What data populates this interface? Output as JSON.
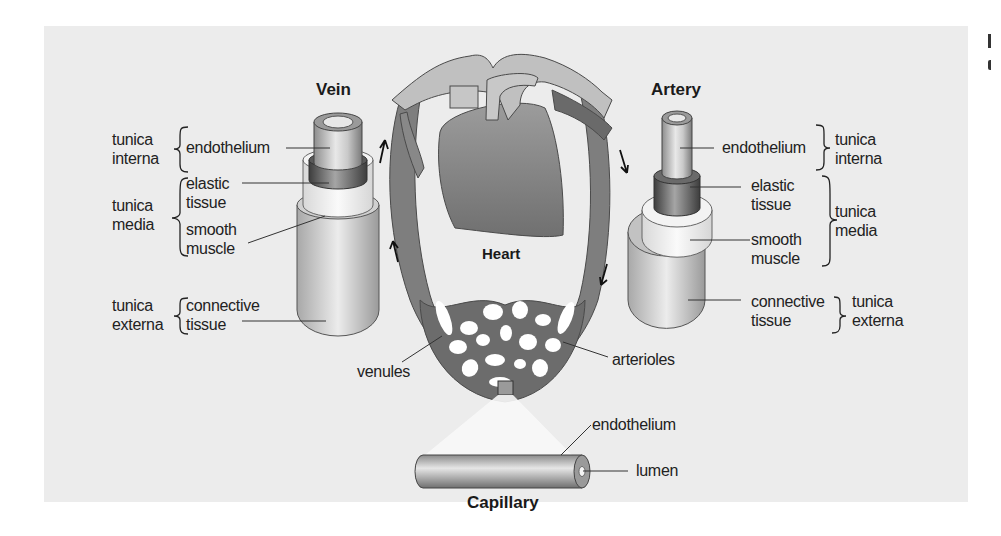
{
  "figure": {
    "background_color": "#ececec",
    "vein": {
      "title": "Vein",
      "groups": [
        {
          "tunica": [
            "tunica",
            "interna"
          ],
          "layers": [
            "endothelium"
          ]
        },
        {
          "tunica": [
            "tunica",
            "media"
          ],
          "layers": [
            "elastic",
            "tissue",
            "smooth",
            "muscle"
          ]
        },
        {
          "tunica": [
            "tunica",
            "externa"
          ],
          "layers": [
            "connective",
            "tissue"
          ]
        }
      ]
    },
    "artery": {
      "title": "Artery",
      "groups": [
        {
          "layers": [
            "endothelium"
          ],
          "tunica": [
            "tunica",
            "interna"
          ]
        },
        {
          "layers": [
            "elastic",
            "tissue",
            "smooth",
            "muscle"
          ],
          "tunica": [
            "tunica",
            "media"
          ]
        },
        {
          "layers": [
            "connective",
            "tissue"
          ],
          "tunica": [
            "tunica",
            "externa"
          ]
        }
      ]
    },
    "heart": {
      "title": "Heart",
      "venules_label": "venules",
      "arterioles_label": "arterioles"
    },
    "capillary": {
      "title": "Capillary",
      "endothelium_label": "endothelium",
      "lumen_label": "lumen"
    },
    "colors": {
      "vessel_dark": "#6e6e6e",
      "vessel_light": "#c4c4c4",
      "heart_fill": "#8a8a8a",
      "text": "#222222"
    }
  }
}
